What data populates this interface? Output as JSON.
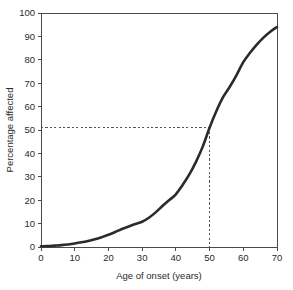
{
  "chart_data": {
    "type": "line",
    "title": "",
    "subtitle": "",
    "xlabel": "Age of onset (years)",
    "ylabel": "Percentage affected",
    "xlim": [
      0,
      70
    ],
    "ylim": [
      0,
      100
    ],
    "xticks": [
      0,
      10,
      20,
      30,
      40,
      50,
      60,
      70
    ],
    "yticks": [
      0,
      10,
      20,
      30,
      40,
      50,
      60,
      70,
      80,
      90,
      100
    ],
    "xtick_labels": [
      "0",
      "10",
      "20",
      "30",
      "40",
      "50",
      "60",
      "70"
    ],
    "ytick_labels": [
      "0",
      "10",
      "20",
      "30",
      "40",
      "50",
      "60",
      "70",
      "80",
      "90",
      "100"
    ],
    "grid": false,
    "legend": false,
    "legend_position": "none",
    "series": [
      {
        "name": "Cumulative percentage affected",
        "color": "#2b2b2b",
        "line_style": "solid",
        "line_width": 2.6,
        "x": [
          0,
          2,
          4,
          6,
          8,
          10,
          12,
          14,
          16,
          18,
          20,
          22,
          24,
          26,
          28,
          30,
          32,
          34,
          36,
          38,
          40,
          42,
          44,
          46,
          48,
          50,
          52,
          54,
          56,
          58,
          60,
          62,
          64,
          66,
          68,
          70
        ],
        "y": [
          0.3,
          0.4,
          0.6,
          0.8,
          1.1,
          1.5,
          2.0,
          2.6,
          3.3,
          4.2,
          5.2,
          6.4,
          7.7,
          8.8,
          9.8,
          10.8,
          12.5,
          14.8,
          17.5,
          20.0,
          22.5,
          26.5,
          31.0,
          36.5,
          43.0,
          51.0,
          58.0,
          64.0,
          68.5,
          73.5,
          79.0,
          83.0,
          86.5,
          89.5,
          92.0,
          94.0
        ]
      }
    ],
    "annotations": [
      {
        "type": "reference-line",
        "orientation": "horizontal",
        "value": 51,
        "style": "dashed",
        "label": "51"
      },
      {
        "type": "reference-line",
        "orientation": "vertical",
        "value": 50,
        "style": "dashed",
        "label": "50"
      }
    ],
    "reference_point": {
      "x": 50,
      "y": 51,
      "description": "median age of onset"
    }
  },
  "axes": {
    "spines": {
      "left": true,
      "bottom": true,
      "top": true,
      "right": true
    },
    "background": "#ffffff"
  }
}
